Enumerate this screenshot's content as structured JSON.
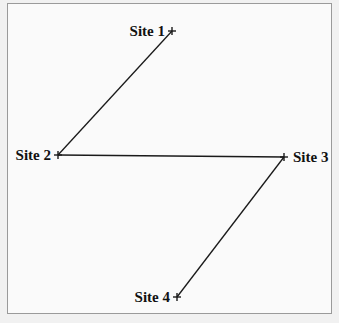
{
  "diagram": {
    "type": "network",
    "nodes": [
      {
        "id": "s1",
        "label": "Site 1",
        "x": 172,
        "y": 31,
        "label_side": "left"
      },
      {
        "id": "s2",
        "label": "Site 2",
        "x": 58,
        "y": 155,
        "label_side": "left"
      },
      {
        "id": "s3",
        "label": "Site 3",
        "x": 284,
        "y": 157,
        "label_side": "right"
      },
      {
        "id": "s4",
        "label": "Site 4",
        "x": 177,
        "y": 297,
        "label_side": "left"
      }
    ],
    "edges": [
      {
        "from": "s1",
        "to": "s2"
      },
      {
        "from": "s2",
        "to": "s3"
      },
      {
        "from": "s3",
        "to": "s4"
      }
    ],
    "colors": {
      "line": "#1a1a1a",
      "background": "#fafafa",
      "border": "#9a9a9a"
    }
  }
}
